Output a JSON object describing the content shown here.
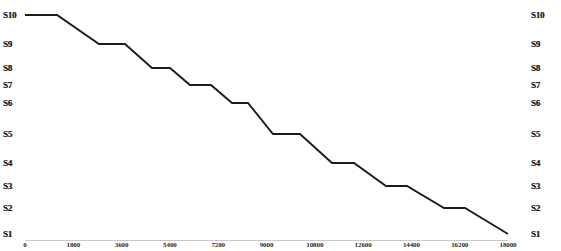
{
  "chart_data": {
    "type": "line",
    "title": "",
    "subtitle": "",
    "xlabel": "",
    "ylabel": "",
    "grid": false,
    "legend": null,
    "line_color": "#1b1b1b",
    "background_color": "#ffffff",
    "axis_color": "#c9c9c9",
    "xlim": [
      0,
      18000
    ],
    "xticks": [
      0,
      1800,
      3600,
      5400,
      7200,
      9000,
      10800,
      12600,
      14400,
      16200,
      18000
    ],
    "xticklabels": [
      "0",
      "1800",
      "3600",
      "5400",
      "7200",
      "9000",
      "10800",
      "12600",
      "14400",
      "16200",
      "18000"
    ],
    "yticklabels_left": [
      "S10",
      "S9",
      "S8",
      "S7",
      "S6",
      "S5",
      "S4",
      "S3",
      "S2",
      "S1"
    ],
    "yticklabels_right": [
      "S10",
      "S9",
      "S8",
      "S7",
      "S6",
      "S5",
      "S4",
      "S3",
      "S2",
      "S1"
    ],
    "ytick_pixel_y": [
      15,
      44,
      68,
      85,
      103,
      134,
      163,
      186,
      208,
      234
    ],
    "y_axis_note": "Ordinal signal-strength levels S10 (top) to S1 (bottom), non-uniform spacing",
    "series": [
      {
        "name": "signal-level",
        "points": [
          {
            "x": 0,
            "y": "S10"
          },
          {
            "x": 600,
            "y": "S10"
          },
          {
            "x": 2300,
            "y": "S9"
          },
          {
            "x": 3300,
            "y": "S9"
          },
          {
            "x": 4300,
            "y": "S8"
          },
          {
            "x": 5000,
            "y": "S8"
          },
          {
            "x": 5800,
            "y": "S7"
          },
          {
            "x": 6600,
            "y": "S7"
          },
          {
            "x": 7400,
            "y": "S6"
          },
          {
            "x": 8000,
            "y": "S6"
          },
          {
            "x": 9000,
            "y": "S5"
          },
          {
            "x": 10000,
            "y": "S5"
          },
          {
            "x": 11200,
            "y": "S4"
          },
          {
            "x": 12000,
            "y": "S4"
          },
          {
            "x": 13200,
            "y": "S3"
          },
          {
            "x": 14000,
            "y": "S3"
          },
          {
            "x": 15400,
            "y": "S2"
          },
          {
            "x": 16200,
            "y": "S2"
          },
          {
            "x": 18000,
            "y": "S1"
          }
        ],
        "pixel_path": "M 25,15 L 57,15 L 99,44 L 125,44 L 152,68 L 170,68 L 190,85 L 211,85 L 232,103 L 248,103 L 273,134 L 300,134 L 332,163 L 354,163 L 386,186 L 407,186 L 444,208 L 465,208 L 508,234"
      }
    ]
  }
}
